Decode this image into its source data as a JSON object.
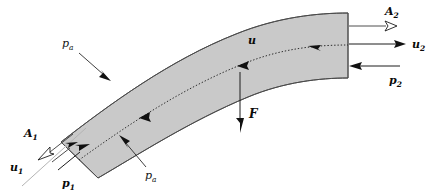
{
  "figure": {
    "background_color": "#ffffff",
    "duct_fill_color": "#c9c9c9",
    "duct_outline_color": "#4a4a4a",
    "label_color": "#0a0a0a",
    "streamline_color": "#b4b4b4"
  },
  "labels": {
    "area_inlet": "A",
    "area_inlet_sub": "1",
    "area_outlet": "A",
    "area_outlet_sub": "2",
    "velocity_inlet": "u",
    "velocity_inlet_sub": "1",
    "velocity_outlet": "u",
    "velocity_outlet_sub": "2",
    "velocity_mid": "u",
    "pressure_inlet": "p",
    "pressure_inlet_sub": "1",
    "pressure_outlet": "p",
    "pressure_outlet_sub": "2",
    "pressure_ambient_top": "p",
    "pressure_ambient_top_sub": "a",
    "pressure_ambient_bottom": "p",
    "pressure_ambient_bottom_sub": "a",
    "force": "F"
  }
}
